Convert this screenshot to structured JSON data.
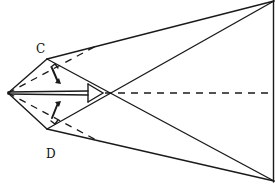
{
  "diagram": {
    "type": "geometric-sketch",
    "labels": {
      "c": "C",
      "d": "D"
    },
    "points": {
      "A": [
        8,
        93
      ],
      "C": [
        47,
        59
      ],
      "D": [
        47,
        129
      ],
      "top_right": [
        274,
        1
      ],
      "bottom_right": [
        274,
        181
      ],
      "mid_right": [
        274,
        93
      ]
    },
    "stroke_color": "#1a1a1a",
    "background": "#ffffff"
  }
}
